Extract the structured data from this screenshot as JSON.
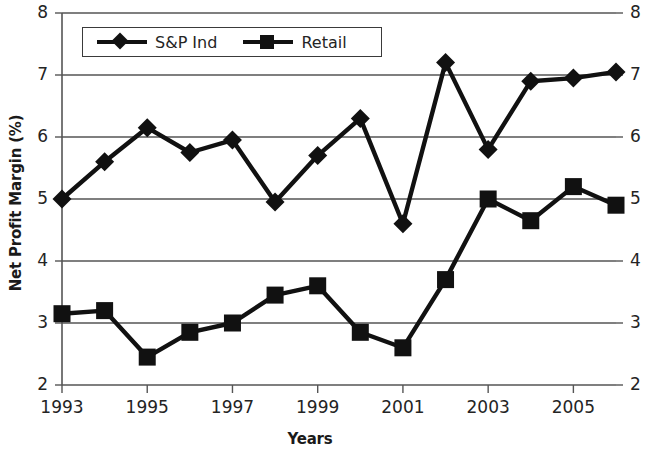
{
  "chart_data": {
    "type": "line",
    "title": "",
    "xlabel": "Years",
    "ylabel": "Net Profit Margin (%)",
    "x": [
      1993,
      1994,
      1995,
      1996,
      1997,
      1998,
      1999,
      2000,
      2001,
      2002,
      2003,
      2004,
      2005,
      2006
    ],
    "xtick_labels": [
      "1993",
      "1995",
      "1997",
      "1999",
      "2001",
      "2003",
      "2005"
    ],
    "xtick_values": [
      1993,
      1995,
      1997,
      1999,
      2001,
      2003,
      2005
    ],
    "xlim": [
      1993,
      2006
    ],
    "ytick_labels": [
      "2",
      "3",
      "4",
      "5",
      "6",
      "7",
      "8"
    ],
    "ytick_values": [
      2,
      3,
      4,
      5,
      6,
      7,
      8
    ],
    "ylim": [
      2,
      8
    ],
    "grid": true,
    "grid_axis": "y",
    "legend_position": "top-left-inside",
    "right_axis_labels": [
      "2",
      "3",
      "4",
      "5",
      "6",
      "7",
      "8"
    ],
    "series": [
      {
        "name": "S&P Ind",
        "marker": "diamond",
        "color": "#111111",
        "values": [
          5.0,
          5.6,
          6.15,
          5.75,
          5.95,
          4.95,
          5.7,
          6.3,
          4.6,
          7.2,
          5.8,
          6.9,
          6.95,
          7.05
        ]
      },
      {
        "name": "Retail",
        "marker": "square",
        "color": "#111111",
        "values": [
          3.15,
          3.2,
          2.45,
          2.85,
          3.0,
          3.45,
          3.6,
          2.85,
          2.6,
          3.7,
          5.0,
          4.65,
          5.2,
          4.9
        ]
      }
    ]
  },
  "legend": {
    "items": [
      {
        "label": "S&P Ind",
        "marker": "diamond"
      },
      {
        "label": "Retail",
        "marker": "square"
      }
    ]
  }
}
